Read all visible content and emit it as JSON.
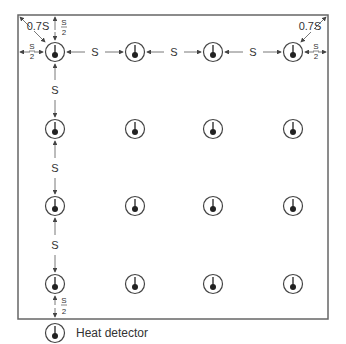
{
  "diagram": {
    "labels": {
      "spacing": "S",
      "half_spacing_num": "S",
      "half_spacing_den": "2",
      "corner": "0.7S"
    },
    "grid": {
      "rows": 4,
      "cols": 4
    },
    "colors": {
      "line": "#666666",
      "detector": "#222222",
      "text": "#333333"
    }
  },
  "legend": {
    "items": [
      {
        "icon": "heat-detector-icon",
        "label": "Heat detector"
      }
    ]
  }
}
